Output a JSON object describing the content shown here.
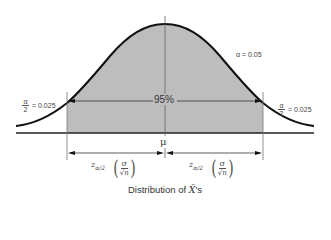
{
  "diagram": {
    "type": "normal-distribution-confidence-interval",
    "title": "Distribution of X̄'s",
    "caption": {
      "prefix": "Distribution of ",
      "symbol": "X̄",
      "suffix": "'s"
    },
    "alpha_label": "α = 0.05",
    "center_label": "μ",
    "confidence_label": "95%",
    "left_tail": {
      "frac_num": "α",
      "frac_den": "2",
      "value": "= 0.025"
    },
    "right_tail": {
      "frac_num": "α",
      "frac_den": "2",
      "value": "= 0.025"
    },
    "left_margin": {
      "z": "z",
      "z_sub": "α/2",
      "se_num": "σ",
      "se_den": "√n"
    },
    "right_margin": {
      "z": "z",
      "z_sub": "α/2",
      "se_num": "σ",
      "se_den": "√n"
    },
    "colors": {
      "curve": "#111111",
      "shaded_area": "#bdbdbd",
      "axis": "#222222",
      "guide_lines": "#777777",
      "text": "#444444"
    }
  }
}
